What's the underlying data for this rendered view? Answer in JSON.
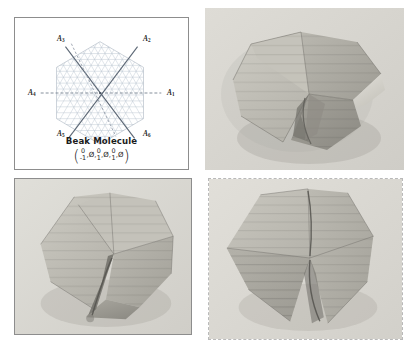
{
  "figure": {
    "panels": [
      {
        "id": "diagram",
        "kind": "schematic-diagram",
        "border": "solid"
      },
      {
        "id": "photo-tr",
        "kind": "photograph",
        "border": "none"
      },
      {
        "id": "photo-bl",
        "kind": "photograph",
        "border": "solid"
      },
      {
        "id": "photo-br",
        "kind": "photograph",
        "border": "dashed"
      }
    ]
  },
  "diagram": {
    "caption_title": "Beak Molecule",
    "axis_labels": [
      {
        "name": "A1",
        "base": "A",
        "sub": "1"
      },
      {
        "name": "A2",
        "base": "A",
        "sub": "2"
      },
      {
        "name": "A3",
        "base": "A",
        "sub": "3"
      },
      {
        "name": "A4",
        "base": "A",
        "sub": "4"
      },
      {
        "name": "A5",
        "base": "A",
        "sub": "5"
      },
      {
        "name": "A6",
        "base": "A",
        "sub": "6"
      }
    ],
    "vector": {
      "open_paren": "(",
      "close_paren": ")",
      "comma": ",",
      "entries": [
        {
          "type": "fraction",
          "numerator": "0",
          "denominator": "-1"
        },
        {
          "type": "symbol",
          "symbol": "Ø"
        },
        {
          "type": "fraction",
          "numerator": "0",
          "denominator": "1"
        },
        {
          "type": "symbol",
          "symbol": "Ø"
        },
        {
          "type": "fraction",
          "numerator": "0",
          "denominator": "1"
        },
        {
          "type": "symbol",
          "symbol": "Ø"
        }
      ],
      "plain_text": "( 0/-1 , Ø , 0/1 , Ø , 0/1 , Ø )"
    },
    "lattice": {
      "type": "triangular-grid",
      "boundary": "hexagon",
      "axis_line_count": 3,
      "grid_color": "#b9c3cf",
      "axis_color": "#5f6b7a",
      "dashed_axis_color": "#8b95a3"
    }
  },
  "photos": {
    "subject": "folded paper origami hexagonal molecule",
    "palette": {
      "background": "#d8d7d2",
      "paper_light": "#c9c7c0",
      "paper_mid": "#b1afa7",
      "paper_dark": "#9b9992",
      "paper_darker": "#85837c",
      "shadow": "#6f6d67"
    },
    "items": [
      {
        "id": "photo-tr",
        "position": "top-right",
        "state": "partly folded beak, two flaps raised"
      },
      {
        "id": "photo-bl",
        "position": "bottom-left",
        "state": "partly folded beak, flap folded over"
      },
      {
        "id": "photo-br",
        "position": "bottom-right",
        "state": "fully folded beak, flat hexagon"
      }
    ]
  },
  "colors": {
    "panel_border": "#8d8d8d",
    "dashed_border": "#b9b9b9",
    "page_background": "#ffffff",
    "text": "#1c1c1c"
  }
}
